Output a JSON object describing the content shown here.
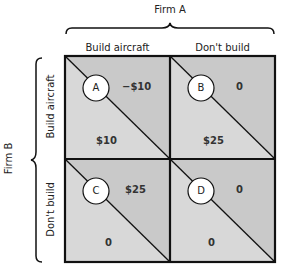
{
  "firm_a": {
    "label": "Firm A"
  },
  "firm_b": {
    "label": "Firm B"
  },
  "columns": [
    {
      "label": "Build aircraft"
    },
    {
      "label": "Don't build"
    }
  ],
  "rows": [
    {
      "label": "Build aircraft"
    },
    {
      "label": "Don't build"
    }
  ],
  "cells": [
    {
      "id": "A",
      "firm_a_payoff": "−$10",
      "firm_b_payoff": "$10"
    },
    {
      "id": "B",
      "firm_a_payoff": "0",
      "firm_b_payoff": "$25"
    },
    {
      "id": "C",
      "firm_a_payoff": "$25",
      "firm_b_payoff": "0"
    },
    {
      "id": "D",
      "firm_a_payoff": "0",
      "firm_b_payoff": "0"
    }
  ],
  "colors": {
    "upper_triangle": "#c9c9c9",
    "lower_triangle": "#d8d8d8",
    "border": "#111111",
    "circle_fill": "#ffffff"
  }
}
